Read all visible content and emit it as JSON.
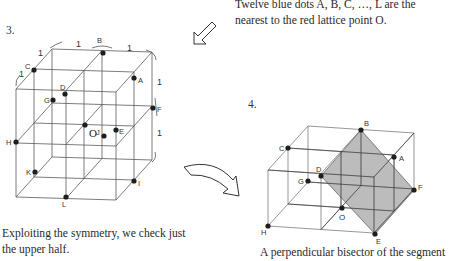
{
  "figure3": {
    "number": "3.",
    "caption_lines": [
      "Exploiting the symmetry, we check just",
      "the upper half."
    ],
    "unit_labels": [
      "1",
      "1",
      "1",
      "1",
      "1",
      "1"
    ],
    "center_label": "O",
    "points": [
      "A",
      "B",
      "C",
      "D",
      "E",
      "F",
      "G",
      "H",
      "I",
      "J",
      "K",
      "L"
    ]
  },
  "figure4": {
    "number": "4.",
    "caption": "A perpendicular bisector of the segment",
    "center_label": "O",
    "points": [
      "A",
      "B",
      "C",
      "D",
      "E",
      "F",
      "G",
      "H"
    ],
    "plane_color": "#a9a9a9"
  },
  "top_note": {
    "lines": [
      "Twelve blue dots A, B, C, …, L are the",
      "nearest to the red lattice point O."
    ]
  },
  "arrows": {
    "top": "hollow-arrow-down-left",
    "middle": "hollow-curved-arrow-down-right"
  },
  "colors": {
    "line": "#555555",
    "dot": "#1e1e1e",
    "text": "#2a2a2a"
  }
}
